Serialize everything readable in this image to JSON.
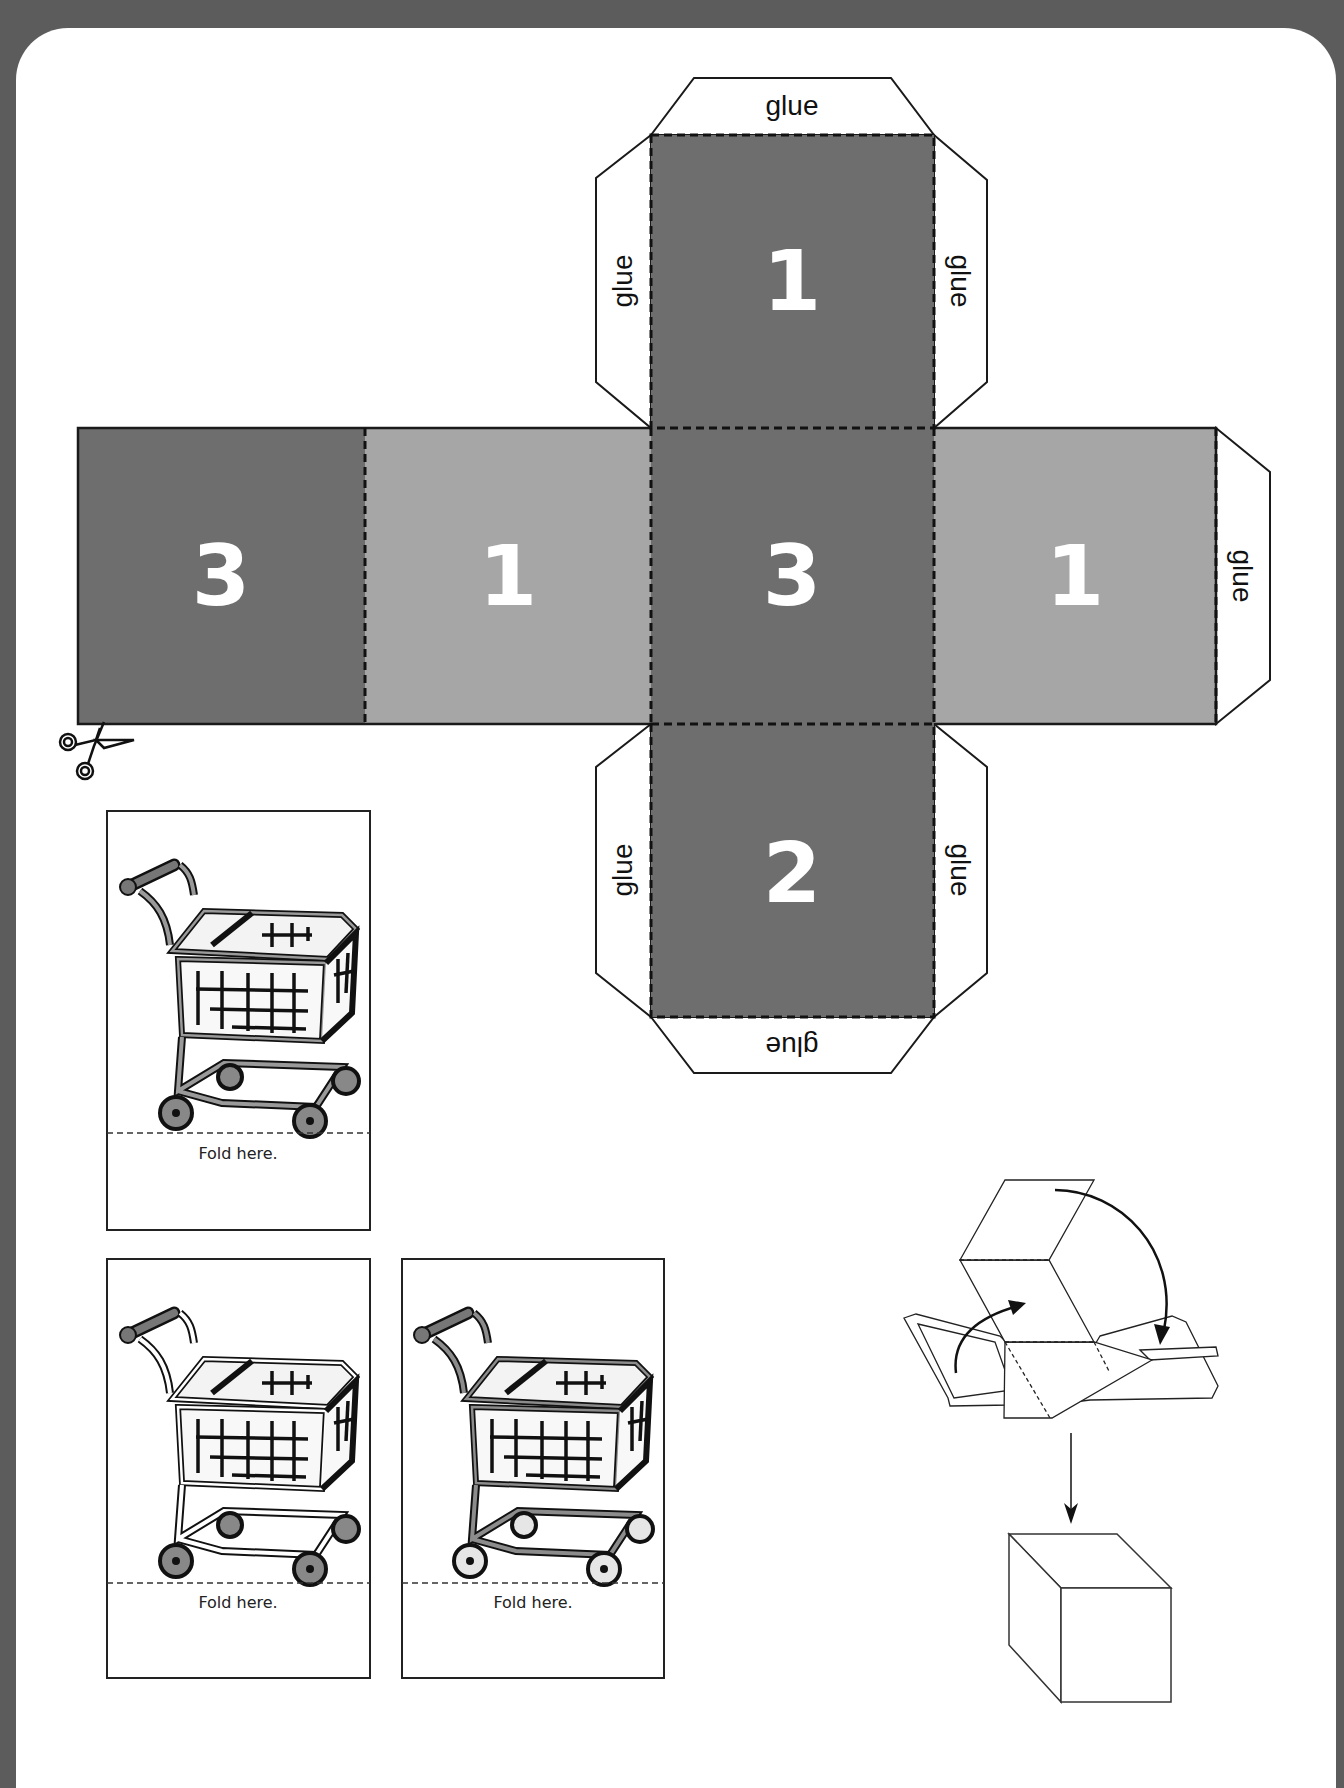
{
  "net": {
    "faces": [
      {
        "id": "top",
        "number": "1",
        "shade": "dark"
      },
      {
        "id": "left-far",
        "number": "3",
        "shade": "dark"
      },
      {
        "id": "left",
        "number": "1",
        "shade": "light"
      },
      {
        "id": "center",
        "number": "3",
        "shade": "dark"
      },
      {
        "id": "right",
        "number": "1",
        "shade": "light"
      },
      {
        "id": "bottom",
        "number": "2",
        "shade": "dark"
      }
    ],
    "glue_label": "glue",
    "colors": {
      "dark": "#6e6e6e",
      "light": "#a6a6a6",
      "outline": "#1a1a1a",
      "frame": "#5c5c5c"
    }
  },
  "cards": [
    {
      "fold_label": "Fold here.",
      "variant": "gray-frame-gray-wheels"
    },
    {
      "fold_label": "Fold here.",
      "variant": "white-frame-gray-wheels"
    },
    {
      "fold_label": "Fold here.",
      "variant": "gray-frame-light-wheels"
    }
  ],
  "icons": {
    "scissors": "scissors-icon",
    "cart": "shopping-cart-icon",
    "cube": "cube-icon"
  }
}
